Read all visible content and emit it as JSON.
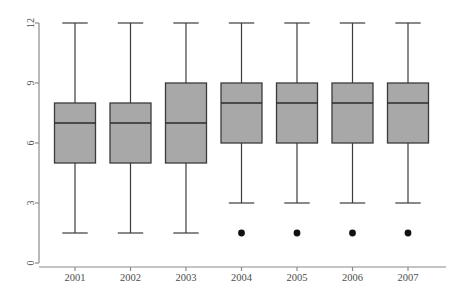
{
  "chart_data": {
    "type": "box",
    "title": "",
    "subtitle": "",
    "xlabel": "",
    "ylabel": "",
    "categories": [
      "2001",
      "2002",
      "2003",
      "2004",
      "2005",
      "2006",
      "2007"
    ],
    "ylim": [
      0,
      12.6
    ],
    "yticks": [
      0,
      3,
      6,
      9,
      12
    ],
    "ytick_labels": [
      "0",
      "3",
      "6",
      "9",
      "12"
    ],
    "ytick_label_rotation": "vertical",
    "grid": false,
    "legend": null,
    "box_fill_color": "#a8a8a8",
    "box_line_color": "#3b3b3b",
    "outlier_color": "#111111",
    "axis_color": "#8a8a8a",
    "series": [
      {
        "name": "2001",
        "lower_whisker": 1.5,
        "q1": 5,
        "median": 7,
        "q3": 8,
        "upper_whisker": 12,
        "outliers": []
      },
      {
        "name": "2002",
        "lower_whisker": 1.5,
        "q1": 5,
        "median": 7,
        "q3": 8,
        "upper_whisker": 12,
        "outliers": []
      },
      {
        "name": "2003",
        "lower_whisker": 1.5,
        "q1": 5,
        "median": 7,
        "q3": 9,
        "upper_whisker": 12,
        "outliers": []
      },
      {
        "name": "2004",
        "lower_whisker": 3,
        "q1": 6,
        "median": 8,
        "q3": 9,
        "upper_whisker": 12,
        "outliers": [
          1.5
        ]
      },
      {
        "name": "2005",
        "lower_whisker": 3,
        "q1": 6,
        "median": 8,
        "q3": 9,
        "upper_whisker": 12,
        "outliers": [
          1.5
        ]
      },
      {
        "name": "2006",
        "lower_whisker": 3,
        "q1": 6,
        "median": 8,
        "q3": 9,
        "upper_whisker": 12,
        "outliers": [
          1.5
        ]
      },
      {
        "name": "2007",
        "lower_whisker": 3,
        "q1": 6,
        "median": 8,
        "q3": 9,
        "upper_whisker": 12,
        "outliers": [
          1.5
        ]
      }
    ]
  },
  "layout": {
    "plot_left": 39,
    "plot_right": 446,
    "plot_top": 16,
    "plot_bottom": 267,
    "y_zero_px": 263,
    "px_per_unit": 20,
    "box_half_width": 20.5,
    "first_center_px": 75,
    "center_spacing_px": 55.5,
    "xlabel_baseline_px": 281,
    "outlier_radius": 3.4
  }
}
